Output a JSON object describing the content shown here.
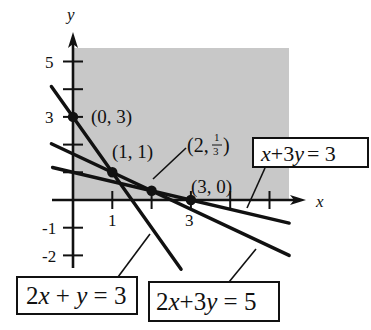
{
  "chart_data": {
    "type": "line",
    "title": "",
    "xlabel": "x",
    "ylabel": "y",
    "x_ticks": [
      {
        "value": 1,
        "label": "1"
      },
      {
        "value": 2,
        "label": ""
      },
      {
        "value": 3,
        "label": "3"
      },
      {
        "value": 4,
        "label": ""
      },
      {
        "value": 5,
        "label": ""
      }
    ],
    "y_ticks": [
      {
        "value": 5,
        "label": "5"
      },
      {
        "value": 4,
        "label": ""
      },
      {
        "value": 3,
        "label": "3"
      },
      {
        "value": 2,
        "label": ""
      },
      {
        "value": 1,
        "label": ""
      },
      {
        "value": -1,
        "label": "-1"
      },
      {
        "value": -2,
        "label": "-2"
      }
    ],
    "shaded_region": {
      "x": [
        0,
        5.5
      ],
      "y": [
        0,
        5.5
      ],
      "color": "#c8c8c8"
    },
    "series": [
      {
        "name": "2x + y = 3",
        "slope": -2,
        "intercept": 3,
        "x_range": [
          -0.55,
          2.75
        ]
      },
      {
        "name": "2x + 3y = 5",
        "slope": -0.6667,
        "intercept": 1.6667,
        "x_range": [
          -0.55,
          5.5
        ]
      },
      {
        "name": "x + 3y = 3",
        "slope": -0.3333,
        "intercept": 1,
        "x_range": [
          -0.52,
          5.5
        ]
      }
    ],
    "points": [
      {
        "x": 0,
        "y": 3,
        "label": "(0, 3)"
      },
      {
        "x": 1,
        "y": 1,
        "label": "(1, 1)"
      },
      {
        "x": 2,
        "y": 0.3333,
        "label": "(2, 1/3)"
      },
      {
        "x": 3,
        "y": 0,
        "label": "(3, 0)"
      }
    ],
    "annotations": [
      {
        "text": "x + 3y = 3",
        "refers_to": "x + 3y = 3"
      },
      {
        "text": "2x + y = 3",
        "refers_to": "2x + y = 3"
      },
      {
        "text": "2x + 3y = 5",
        "refers_to": "2x + 3y = 5"
      }
    ],
    "xlim": [
      -0.55,
      5.8
    ],
    "ylim": [
      -2.5,
      6.1
    ],
    "grid": false
  },
  "labels": {
    "x_axis": "x",
    "y_axis": "y",
    "pt_0_3": "(0, 3)",
    "pt_1_1": "(1, 1)",
    "pt_2_prefix": "(2,",
    "pt_2_num": "1",
    "pt_2_den": "3",
    "pt_2_close": ")",
    "pt_3_0": "(3, 0)",
    "tick_x1": "1",
    "tick_x3": "3",
    "tick_y5": "5",
    "tick_y3": "3",
    "tick_yn1": "-1",
    "tick_yn2": "-2",
    "eq1": {
      "a": "x",
      "b": "+3",
      "c": "y",
      "d": "= 3"
    },
    "eq2": {
      "a": "2",
      "b": "x",
      "c": " + ",
      "d": "y",
      "e": " = 3"
    },
    "eq3": {
      "a": "2",
      "b": "x",
      "c": "+3",
      "d": "y",
      "e": " = 5"
    }
  }
}
